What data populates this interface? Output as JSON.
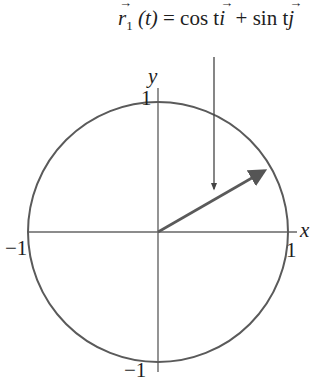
{
  "figure": {
    "formula": {
      "vector_symbol": "r",
      "subscript": "1",
      "param": "(t)",
      "equals": "=",
      "cos_term": "cos t",
      "i_unit": "i",
      "plus": "+",
      "sin_term": "sin t",
      "j_unit": "j",
      "arrow_glyph": "→"
    },
    "axes": {
      "x_label": "x",
      "y_label": "y",
      "x_pos_tick": "1",
      "x_neg_tick": "−1",
      "y_pos_tick": "1",
      "y_neg_tick": "−1"
    },
    "circle": {
      "center": [
        0,
        0
      ],
      "radius": 1
    },
    "vector": {
      "angle_deg": 30,
      "description": "position vector from origin to point on unit circle"
    },
    "colors": {
      "stroke": "#555555",
      "text": "#1e1e1e",
      "background": "#ffffff"
    }
  }
}
